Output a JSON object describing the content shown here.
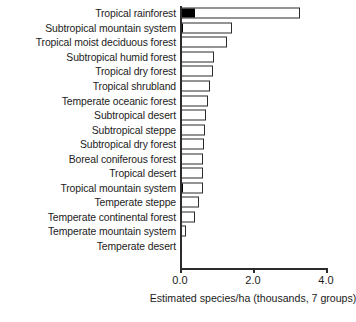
{
  "chart_data": {
    "type": "bar",
    "orientation": "horizontal",
    "title": "",
    "subtitle": "",
    "xlabel": "Estimated species/ha (thousands, 7 groups)",
    "ylabel": "",
    "xlim": [
      0.0,
      4.0
    ],
    "xticks": [
      0.0,
      2.0,
      4.0
    ],
    "xtick_labels": [
      "0.0",
      "2.0",
      "4.0"
    ],
    "grid": false,
    "legend": null,
    "bar_style": {
      "fill": "#ffffff",
      "edge": "#2b2b2b",
      "highlight_fill": "#000000"
    },
    "categories": [
      "Tropical rainforest",
      "Subtropical mountain system",
      "Tropical moist deciduous forest",
      "Subtropical humid forest",
      "Tropical dry forest",
      "Tropical shrubland",
      "Temperate oceanic forest",
      "Subtropical desert",
      "Subtropical steppe",
      "Subtropical dry forest",
      "Boreal coniferous forest",
      "Tropical desert",
      "Tropical mountain system",
      "Temperate steppe",
      "Temperate continental forest",
      "Temperate mountain system",
      "Temperate desert"
    ],
    "values": [
      3.3,
      1.42,
      1.28,
      0.93,
      0.9,
      0.82,
      0.76,
      0.7,
      0.69,
      0.65,
      0.64,
      0.64,
      0.62,
      0.52,
      0.42,
      0.17,
      0.04
    ],
    "dark_segment_values": [
      0.38,
      0.06,
      0.0,
      0.0,
      0.0,
      0.0,
      0.0,
      0.0,
      0.0,
      0.0,
      0.0,
      0.0,
      0.05,
      0.0,
      0.0,
      0.03,
      0.0
    ]
  }
}
